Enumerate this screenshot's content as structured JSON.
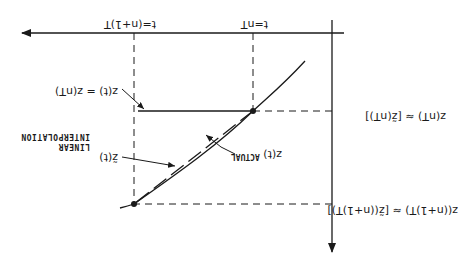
{
  "orientation": "rotated 180 degrees",
  "colors": {
    "ink": "#1a1a1a",
    "background": "#ffffff"
  },
  "diagram": {
    "axes": {
      "horizontal": {
        "label": "time axis",
        "direction": "arrow"
      },
      "vertical": {
        "label": "depth axis",
        "direction": "arrow"
      }
    },
    "tick_labels": {
      "t_n_plus_1": "t=(n+1)T",
      "t_n": "t=nT"
    },
    "labels": {
      "actual_value_n_plus_1": "z((n+1)T)",
      "approx_value_n_plus_1": "≈ [z̃((n+1)T)]",
      "actual_value_n": "z(nT)",
      "approx_value_n": "≈ [z̃(nT)]",
      "hold_label": "z(t) = z(nT)",
      "actual_curve_symbol": "z(t)",
      "actual_curve_label": "ACTUAL",
      "interp_symbol": "z̃(t)",
      "interp_label_line1": "LINEAR",
      "interp_label_line2": "INTERPOLATION"
    },
    "points": [
      {
        "name": "sample-n",
        "x": 215,
        "y": 152
      },
      {
        "name": "sample-n-plus-1",
        "x": 334,
        "y": 59
      }
    ]
  }
}
